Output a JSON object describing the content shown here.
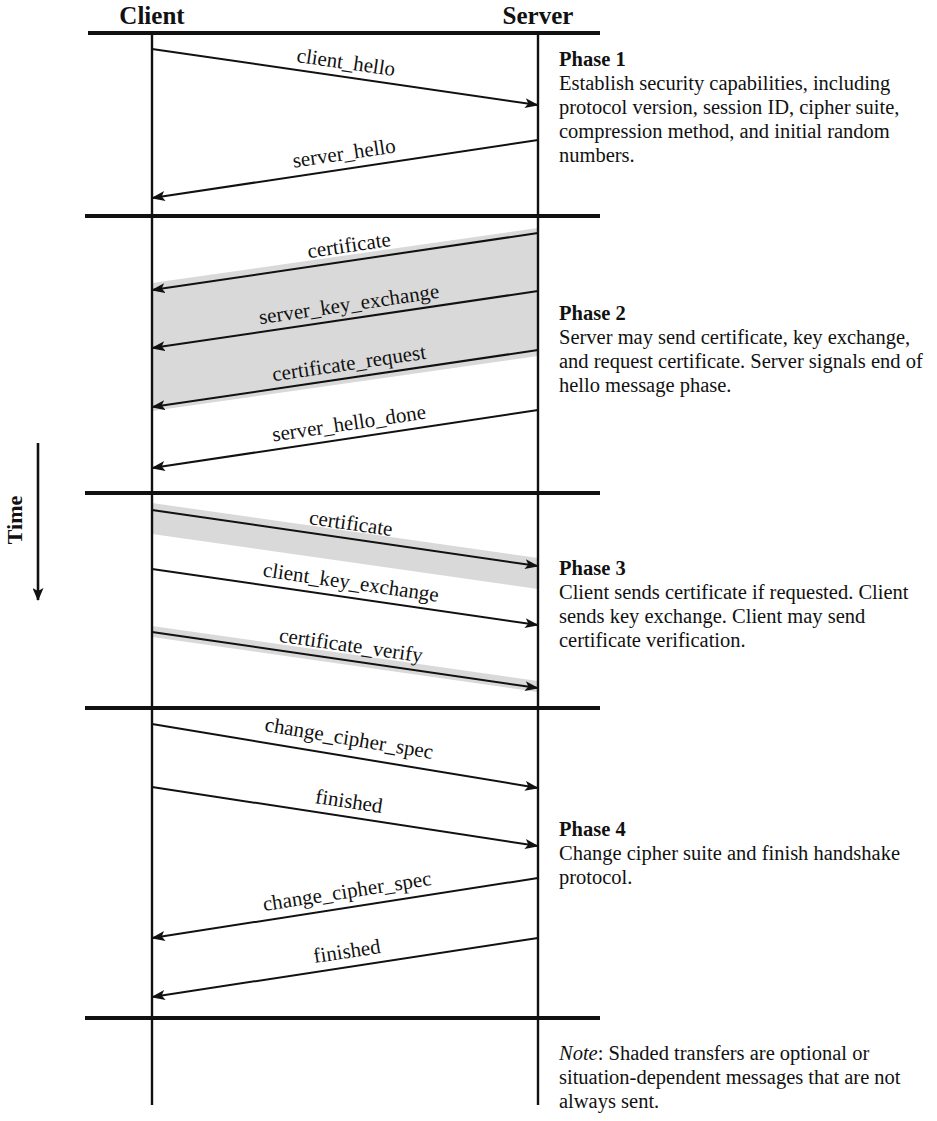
{
  "diagram": {
    "actors": {
      "client": "Client",
      "server": "Server"
    },
    "time_axis_label": "Time",
    "shade_color": "#d9d9d9",
    "line_color": "#111111"
  },
  "messages": {
    "client_hello": "client_hello",
    "server_hello": "server_hello",
    "certificate": "certificate",
    "server_key_exchange": "server_key_exchange",
    "certificate_request": "certificate_request",
    "server_hello_done": "server_hello_done",
    "certificate_p3": "certificate",
    "client_key_exchange": "client_key_exchange",
    "certificate_verify": "certificate_verify",
    "change_cipher_spec_c2s": "change_cipher_spec",
    "finished_c2s": "finished",
    "change_cipher_spec_s2c": "change_cipher_spec",
    "finished_s2c": "finished"
  },
  "phases": [
    {
      "title": "Phase 1",
      "description": "Establish security capabilities, including protocol version, session ID, cipher suite, compression method, and initial random numbers."
    },
    {
      "title": "Phase 2",
      "description": "Server may send certificate, key exchange, and request certificate. Server signals end of hello message phase."
    },
    {
      "title": "Phase 3",
      "description": "Client sends certificate if requested. Client sends key exchange. Client may send certificate verification."
    },
    {
      "title": "Phase 4",
      "description": "Change cipher suite and finish handshake protocol."
    }
  ],
  "note": {
    "label": "Note",
    "separator": ": ",
    "text": "Shaded transfers are optional or situation-dependent messages that are not always sent."
  }
}
